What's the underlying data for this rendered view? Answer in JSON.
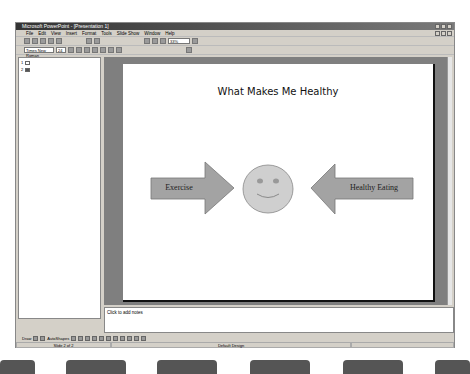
{
  "window": {
    "title": "Microsoft PowerPoint - [Presentation 1]"
  },
  "menu": [
    "File",
    "Edit",
    "View",
    "Insert",
    "Format",
    "Tools",
    "Slide Show",
    "Window",
    "Help"
  ],
  "toolbar": {
    "zoom": "33%",
    "font": "Times New Roman",
    "size": "24"
  },
  "outline": {
    "slides": [
      "1",
      "2"
    ]
  },
  "slide": {
    "title": "What Makes Me Healthy",
    "left_arrow": "Exercise",
    "right_arrow": "Healthy Eating"
  },
  "notes": {
    "placeholder": "Click to add notes"
  },
  "drawbar": {
    "draw": "Draw",
    "autoshapes": "AutoShapes"
  },
  "status": {
    "slide": "Slide 2 of 2",
    "design": "Default Design"
  }
}
